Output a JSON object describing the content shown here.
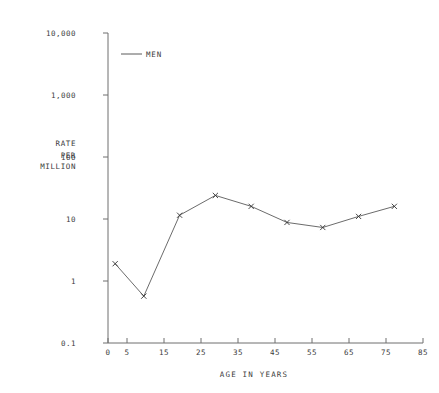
{
  "chart_data": {
    "type": "line",
    "title": "",
    "xlabel": "AGE IN YEARS",
    "ylabel": "RATE\nPER\nMILLION",
    "ylabel_lines": [
      "RATE",
      "PER",
      "MILLION"
    ],
    "yscale": "log",
    "ylim": [
      0.1,
      10000
    ],
    "xlim": [
      0,
      88
    ],
    "grid": false,
    "legend_position": "top-left-inside",
    "yticks": [
      0.1,
      1,
      10,
      100,
      1000,
      10000
    ],
    "ytick_labels": [
      "0.1",
      "1",
      "10",
      "100",
      "1,000",
      "10,000"
    ],
    "xticks": [
      0,
      5,
      15,
      25,
      35,
      45,
      55,
      65,
      75,
      85
    ],
    "xtick_labels": [
      "0",
      "5",
      "15",
      "25",
      "35",
      "45",
      "55",
      "65",
      "75",
      "85"
    ],
    "series": [
      {
        "name": "MEN",
        "marker": "x",
        "color": "#444444",
        "x": [
          2,
          10,
          20,
          30,
          40,
          50,
          60,
          70,
          80
        ],
        "values": [
          1.9,
          0.57,
          11.5,
          24,
          16,
          8.8,
          7.3,
          11,
          16
        ]
      }
    ]
  },
  "legend": {
    "entries": [
      {
        "label": "MEN"
      }
    ]
  },
  "axes": {
    "y_title_lines": [
      "RATE",
      "PER",
      "MILLION"
    ],
    "x_title": "AGE IN YEARS"
  }
}
